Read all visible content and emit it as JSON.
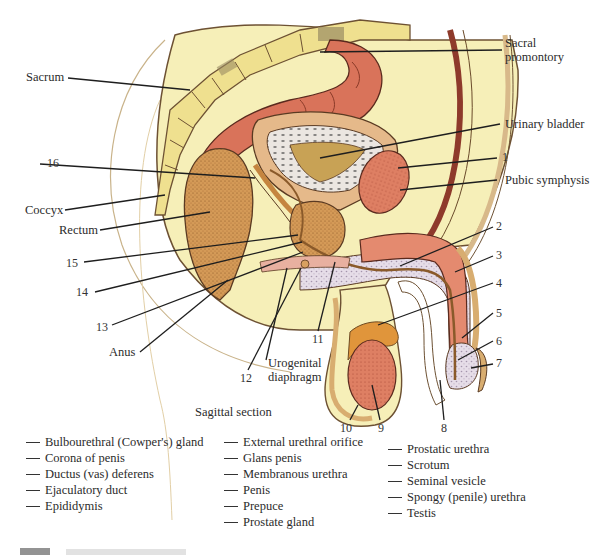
{
  "figure": {
    "view_label": "Sagittal section",
    "callouts": {
      "sacral_promontory": "Sacral\npromontory",
      "sacrum": "Sacrum",
      "urinary_bladder": "Urinary bladder",
      "pubic_symphysis": "Pubic symphysis",
      "coccyx": "Coccyx",
      "rectum": "Rectum",
      "anus": "Anus",
      "urogenital_diaphragm": "Urogenital\ndiaphragm"
    },
    "numbers": [
      "1",
      "2",
      "3",
      "4",
      "5",
      "6",
      "7",
      "8",
      "9",
      "10",
      "11",
      "12",
      "13",
      "14",
      "15",
      "16"
    ],
    "colors": {
      "tissue_yellow": "#f6efb8",
      "bone": "#efe08f",
      "colon": "#d9735a",
      "rectum": "#d39a55",
      "erectile": "#e48a6f",
      "spongy": "#ddd3e0",
      "outline": "#5a3a22"
    }
  },
  "key": {
    "column1": [
      "Bulbourethral (Cowper's) gland",
      "Corona of penis",
      "Ductus (vas) deferens",
      "Ejaculatory duct",
      "Epididymis"
    ],
    "column2": [
      "External urethral orifice",
      "Glans penis",
      "Membranous urethra",
      "Penis",
      "Prepuce",
      "Prostate gland"
    ],
    "column3": [
      "Prostatic urethra",
      "Scrotum",
      "Seminal vesicle",
      "Spongy (penile) urethra",
      "Testis"
    ]
  }
}
